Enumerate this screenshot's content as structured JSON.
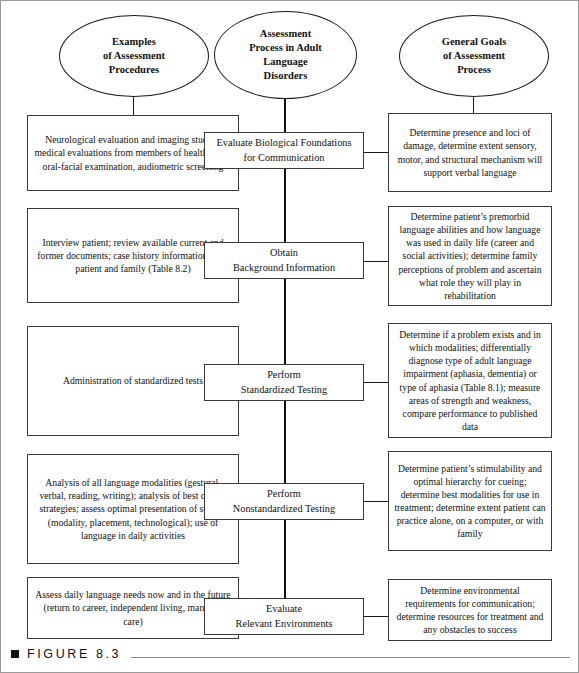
{
  "figure": {
    "bullet": "square-bullet",
    "label": "FIGURE  8.3"
  },
  "headers": [
    {
      "id": "examples-of-assessment-procedures",
      "text": "Examples\nof Assessment\nProcedures"
    },
    {
      "id": "assessment-process-in-adult-language-disorders",
      "text": "Assessment\nProcess in Adult\nLanguage\nDisorders"
    },
    {
      "id": "general-goals-of-assessment-process",
      "text": "General Goals\nof Assessment\nProcess"
    }
  ],
  "rows": [
    {
      "id": "evaluate-biological-foundations",
      "left": "Neurological evaluation and imaging studies, medical evaluations from members of health team; oral-facial examination, audiometric screening",
      "center": "Evaluate Biological Foundations\nfor Communication",
      "right": "Determine presence and loci of damage, determine extent sensory, motor, and structural mechanism will support verbal language"
    },
    {
      "id": "obtain-background-information",
      "left": "Interview patient; review available current and former documents; case history information from patient and family (Table 8.2)",
      "center": "Obtain\nBackground Information",
      "right": "Determine patient’s premorbid language abilities and how language was used in daily life (career and social activities); determine family perceptions of problem and ascertain what role they will play in rehabilitation"
    },
    {
      "id": "perform-standardized-testing",
      "left": "Administration of standardized tests",
      "center": "Perform\nStandardized Testing",
      "right": "Determine if a problem exists and in which modalities; differentially diagnose type of adult language impairment (aphasia, dementia) or type of aphasia (Table 8.1); measure areas of strength and weakness, compare performance to published data"
    },
    {
      "id": "perform-nonstandardized-testing",
      "left": "Analysis of all language modalities (gestural, verbal, reading, writing); analysis of best cueing strategies; assess optimal presentation of stimuli (modality, placement, technological); use of language in daily activities",
      "center": "Perform\nNonstandardized Testing",
      "right": "Determine patient’s stimulability and optimal hierarchy for cueing; determine best modalities for use in treatment; determine extent patient can practice alone, on a computer, or with family"
    },
    {
      "id": "evaluate-relevant-environments",
      "left": "Assess daily language needs now and in the future (return to career, independent living, managed care)",
      "center": "Evaluate\nRelevant Environments",
      "right": "Determine environmental requirements for communication; determine resources for treatment and any obstacles to success"
    }
  ],
  "colors": {
    "ink": "#111111",
    "box_border": "#3a3a3a",
    "page_border": "#9a9a9a",
    "rule": "#8d8d8d",
    "background": "#ffffff"
  }
}
